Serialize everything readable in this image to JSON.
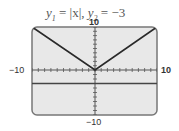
{
  "title": {
    "y1_var": "y",
    "y1_sub": "1",
    "y1_expr": " = |x|,  ",
    "y2_var": "y",
    "y2_sub": "2",
    "y2_expr": " = −3"
  },
  "axis_labels": {
    "y_max": "10",
    "y_min": "−10",
    "x_min": "−10",
    "x_max": "10"
  },
  "colors": {
    "screen_bg": "#e8e8e8",
    "screen_border": "#777777",
    "graph_line": "#2a2a2a",
    "axis": "#555555"
  },
  "chart_data": {
    "type": "line",
    "title": "y1 = |x|, y2 = −3",
    "xlabel": "",
    "ylabel": "",
    "xlim": [
      -10,
      10
    ],
    "ylim": [
      -10,
      10
    ],
    "x_ticks_step": 1,
    "y_ticks_step": 1,
    "grid": false,
    "series": [
      {
        "name": "y1 = |x|",
        "x": [
          -10,
          0,
          10
        ],
        "values": [
          10,
          0,
          10
        ]
      },
      {
        "name": "y2 = -3",
        "x": [
          -10,
          10
        ],
        "values": [
          -3,
          -3
        ]
      }
    ],
    "annotations": [
      "10",
      "−10",
      "−10",
      "10"
    ]
  }
}
